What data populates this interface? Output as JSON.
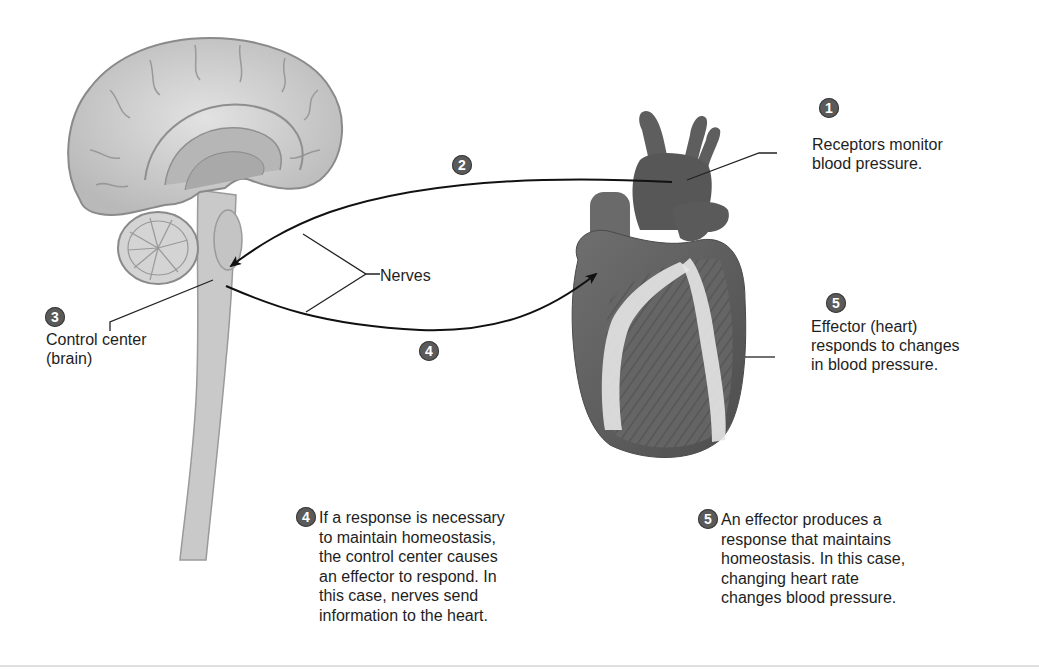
{
  "diagram": {
    "step_badges": {
      "receptors": "1",
      "afferent": "2",
      "control_center": "3",
      "efferent": "4",
      "effector": "5"
    },
    "labels": {
      "receptors": [
        "Receptors monitor",
        "blood pressure."
      ],
      "control_center": [
        "Control center",
        "(brain)"
      ],
      "effector": [
        "Effector (heart)",
        "responds to changes",
        "in blood pressure."
      ],
      "nerves": "Nerves"
    },
    "captions": {
      "step4": {
        "badge": "4",
        "lines": [
          "If a response is necessary",
          "to maintain homeostasis,",
          "the control center causes",
          "an effector to respond. In",
          "this case, nerves send",
          "information to the heart."
        ]
      },
      "step5": {
        "badge": "5",
        "lines": [
          "An effector produces a",
          "response that maintains",
          "homeostasis. In this case,",
          "changing heart rate",
          "changes blood pressure."
        ]
      }
    },
    "illustrations": [
      "brain-sagittal-illustration",
      "heart-illustration"
    ],
    "colors": {
      "badge": "#5a5a5a",
      "line": "#1a1a1a",
      "brain": "#cfcfcf",
      "heart": "#6b6b6b"
    }
  }
}
